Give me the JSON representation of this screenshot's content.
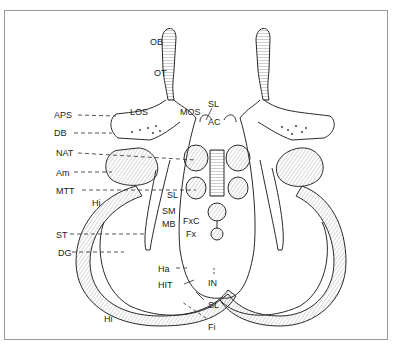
{
  "diagram": {
    "type": "anatomical-line-drawing",
    "line_color": "#2a2a2a",
    "frame_color": "#9a9a9a",
    "labels": {
      "OB": "OB",
      "OT": "OT",
      "APS": "APS",
      "LOS": "LOS",
      "MOS": "MOS",
      "SL_top": "SL",
      "AC": "AC",
      "DB": "DB",
      "NAT": "NAT",
      "Am": "Am",
      "MTT": "MTT",
      "Hi_upper": "Hi",
      "SL_mid": "SL",
      "SM": "SM",
      "MB": "MB",
      "FxC": "FxC",
      "Fx": "Fx",
      "ST": "ST",
      "DG": "DG",
      "Ha": "Ha",
      "HIT": "HIT",
      "IN": "IN",
      "SL_low": "SL",
      "Hi_lower": "Hi",
      "Fi": "Fi"
    }
  }
}
